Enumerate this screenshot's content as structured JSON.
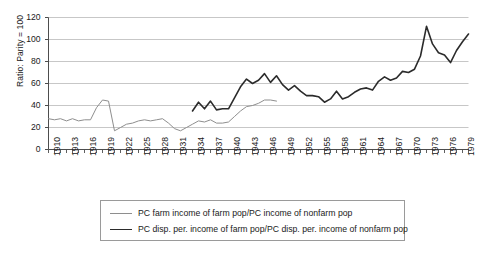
{
  "chart_data": {
    "type": "line",
    "title": "",
    "xlabel": "",
    "ylabel": "Ratio: Parity = 100",
    "xlim": [
      1910,
      1980
    ],
    "ylim": [
      0,
      120
    ],
    "ytick_values": [
      0,
      20,
      40,
      60,
      80,
      100,
      120
    ],
    "ytick_labels": [
      "0",
      "20",
      "40",
      "60",
      "80",
      "100",
      "120"
    ],
    "xtick_labels": [
      "1910",
      "1913",
      "1916",
      "1919",
      "1922",
      "1925",
      "1928",
      "1931",
      "1934",
      "1937",
      "1940",
      "1943",
      "1946",
      "1949",
      "1952",
      "1955",
      "1958",
      "1961",
      "1964",
      "1967",
      "1970",
      "1973",
      "1976",
      "1979"
    ],
    "xtick_step": 3,
    "minor_xticks": "annual",
    "grid": "horizontal",
    "legend_position": "below-axes",
    "colors": {
      "series_1": "#8e8e8e",
      "series_2": "#2b2b2b",
      "grid": "#b9b9b9",
      "axis": "#4d4d4d"
    },
    "series": [
      {
        "name": "PC farm income of farm pop/PC income of nonfarm pop",
        "color": "#8e8e8e",
        "width": 1.0,
        "x": [
          1910,
          1911,
          1912,
          1913,
          1914,
          1915,
          1916,
          1917,
          1918,
          1919,
          1920,
          1921,
          1922,
          1923,
          1924,
          1925,
          1926,
          1927,
          1928,
          1929,
          1930,
          1931,
          1932,
          1933,
          1934,
          1935,
          1936,
          1937,
          1938,
          1939,
          1940,
          1941,
          1942,
          1943,
          1944,
          1945,
          1946,
          1947,
          1948
        ],
        "values": [
          28,
          27,
          28,
          26,
          28,
          26,
          27,
          27,
          38,
          45,
          44,
          17,
          20,
          23,
          24,
          26,
          27,
          26,
          27,
          28,
          24,
          19,
          17,
          20,
          23,
          26,
          25,
          27,
          24,
          24,
          25,
          30,
          35,
          39,
          40,
          42,
          45,
          45,
          44
        ]
      },
      {
        "name": "PC disp. per. income of farm pop/PC disp. per. income of nonfarm pop",
        "color": "#2b2b2b",
        "width": 1.6,
        "x": [
          1934,
          1935,
          1936,
          1937,
          1938,
          1939,
          1940,
          1941,
          1942,
          1943,
          1944,
          1945,
          1946,
          1947,
          1948,
          1949,
          1950,
          1951,
          1952,
          1953,
          1954,
          1955,
          1956,
          1957,
          1958,
          1959,
          1960,
          1961,
          1962,
          1963,
          1964,
          1965,
          1966,
          1967,
          1968,
          1969,
          1970,
          1971,
          1972,
          1973,
          1974,
          1975,
          1976,
          1977,
          1978,
          1979,
          1980
        ],
        "values": [
          35,
          43,
          37,
          44,
          36,
          37,
          37,
          47,
          57,
          64,
          60,
          63,
          69,
          61,
          67,
          59,
          54,
          58,
          53,
          49,
          49,
          48,
          43,
          46,
          53,
          46,
          48,
          52,
          55,
          56,
          54,
          62,
          66,
          63,
          65,
          71,
          70,
          73,
          85,
          112,
          96,
          88,
          86,
          79,
          90,
          98,
          105
        ]
      }
    ]
  },
  "legend": {
    "items": [
      {
        "label": "PC farm income of farm pop/PC income of nonfarm pop"
      },
      {
        "label": "PC disp. per. income of farm pop/PC disp. per. income of nonfarm pop"
      }
    ]
  }
}
